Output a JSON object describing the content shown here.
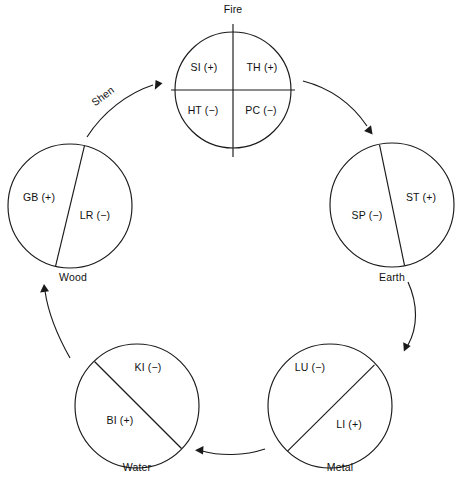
{
  "diagram": {
    "cycle_label": "Shen",
    "background_color": "#ffffff",
    "stroke_color": "#1a1a1a",
    "text_color": "#111111"
  },
  "phases": [
    {
      "id": "fire",
      "name": "Fire",
      "label_x": 233,
      "label_y": 13,
      "center_x": 233,
      "center_y": 90,
      "radius": 58,
      "division": "quadrants",
      "organs": [
        {
          "code": "SI",
          "polarity": "(+)",
          "text": "SI (+)",
          "x": 204,
          "y": 71
        },
        {
          "code": "TH",
          "polarity": "(+)",
          "text": "TH (+)",
          "x": 262,
          "y": 71
        },
        {
          "code": "HT",
          "polarity": "(−)",
          "text": "HT (−)",
          "x": 203,
          "y": 114
        },
        {
          "code": "PC",
          "polarity": "(−)",
          "text": "PC (−)",
          "x": 261,
          "y": 114
        }
      ]
    },
    {
      "id": "earth",
      "name": "Earth",
      "label_x": 392,
      "label_y": 281,
      "center_x": 392,
      "center_y": 205,
      "radius": 62,
      "division": "chord",
      "organs": [
        {
          "code": "SP",
          "polarity": "(−)",
          "text": "SP (−)",
          "x": 367,
          "y": 219
        },
        {
          "code": "ST",
          "polarity": "(+)",
          "text": "ST (+)",
          "x": 421,
          "y": 201
        }
      ]
    },
    {
      "id": "metal",
      "name": "Metal",
      "label_x": 340,
      "label_y": 471,
      "center_x": 330,
      "center_y": 406,
      "radius": 62,
      "division": "chord",
      "organs": [
        {
          "code": "LU",
          "polarity": "(−)",
          "text": "LU (−)",
          "x": 310,
          "y": 371
        },
        {
          "code": "LI",
          "polarity": "(+)",
          "text": "LI (+)",
          "x": 349,
          "y": 428
        }
      ]
    },
    {
      "id": "water",
      "name": "Water",
      "label_x": 137,
      "label_y": 471,
      "center_x": 137,
      "center_y": 406,
      "radius": 62,
      "division": "chord",
      "organs": [
        {
          "code": "KI",
          "polarity": "(−)",
          "text": "KI (−)",
          "x": 148,
          "y": 371
        },
        {
          "code": "BI",
          "polarity": "(+)",
          "text": "BI (+)",
          "x": 120,
          "y": 424
        }
      ]
    },
    {
      "id": "wood",
      "name": "Wood",
      "label_x": 73,
      "label_y": 281,
      "center_x": 70,
      "center_y": 206,
      "radius": 62,
      "division": "chord",
      "organs": [
        {
          "code": "GB",
          "polarity": "(+)",
          "text": "GB (+)",
          "x": 39,
          "y": 201
        },
        {
          "code": "LR",
          "polarity": "(−)",
          "text": "LR (−)",
          "x": 95,
          "y": 219
        }
      ]
    }
  ],
  "flow": {
    "sequence": [
      "Wood",
      "Fire",
      "Earth",
      "Metal",
      "Water",
      "Wood"
    ],
    "arrows": [
      {
        "id": "wood-to-fire",
        "from": "Wood",
        "to": "Fire",
        "labeled": "Shen"
      },
      {
        "id": "fire-to-earth",
        "from": "Fire",
        "to": "Earth",
        "labeled": ""
      },
      {
        "id": "earth-to-metal",
        "from": "Earth",
        "to": "Metal",
        "labeled": ""
      },
      {
        "id": "metal-to-water",
        "from": "Metal",
        "to": "Water",
        "labeled": ""
      },
      {
        "id": "water-to-wood",
        "from": "Water",
        "to": "Wood",
        "labeled": ""
      }
    ]
  }
}
